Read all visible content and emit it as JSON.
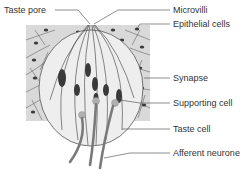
{
  "diagram": {
    "labels": {
      "taste_pore": "Taste pore",
      "microvilli": "Microvilli",
      "epithelial_cells": "Epithelial cells",
      "synapse": "Synapse",
      "supporting_cell": "Supporting cell",
      "taste_cell": "Taste cell",
      "afferent_neurone": "Afferent neurone"
    },
    "colors": {
      "epithelium": "#d9d9d9",
      "bud": "#eeeeee",
      "nucleus": "#3a3a3a",
      "synapse_dot": "#b0b0b0",
      "nerve": "#7a7a7a",
      "line": "#555555"
    }
  }
}
